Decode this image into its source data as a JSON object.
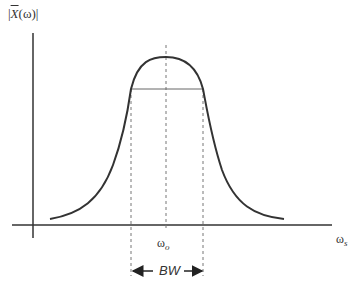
{
  "diagram": {
    "type": "bandpass-magnitude-response",
    "y_axis_label": {
      "prefix": "|",
      "symbol": "X",
      "arg": "(ω)",
      "suffix": "|"
    },
    "x_axis_label": {
      "symbol": "ω",
      "subscript": "s"
    },
    "center_frequency_label": {
      "symbol": "ω",
      "subscript": "o"
    },
    "bandwidth_label": "BW",
    "colors": {
      "axis": "#333333",
      "curve": "#333333",
      "dashed": "#777777",
      "halfpower_line": "#666666"
    }
  }
}
